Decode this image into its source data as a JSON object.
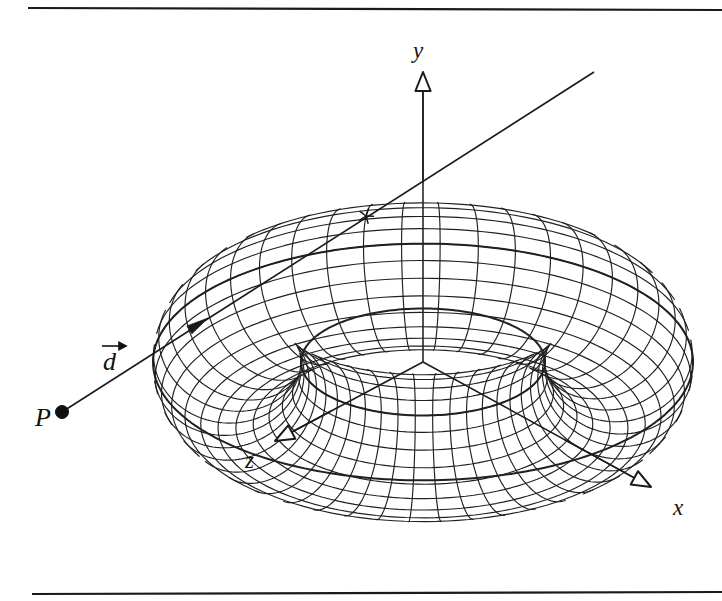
{
  "figure": {
    "background_color": "#ffffff",
    "ink_color": "#1a1a1a",
    "width": 722,
    "height": 601
  },
  "rules": {
    "top": {
      "name": "top-rule",
      "x1": 28,
      "y1": 8,
      "x2": 722,
      "y2": 10
    },
    "bottom": {
      "name": "bottom-rule",
      "x1": 32,
      "y1": 594,
      "x2": 722,
      "y2": 592
    }
  },
  "axes": {
    "origin": {
      "x": 423,
      "y": 362
    },
    "items": [
      {
        "id": "y",
        "label": "y",
        "label_x": 413,
        "label_y": 58,
        "tip_x": 423,
        "tip_y": 72,
        "head": "hollow-triangle"
      },
      {
        "id": "x",
        "label": "x",
        "label_x": 673,
        "label_y": 515,
        "tip_x": 651,
        "tip_y": 487,
        "head": "hollow-triangle"
      },
      {
        "id": "z",
        "label": "z",
        "label_x": 245,
        "label_y": 468,
        "tip_x": 275,
        "tip_y": 441,
        "head": "hollow-triangle"
      }
    ]
  },
  "ray": {
    "origin_label": "P",
    "origin_label_x": 35,
    "origin_label_y": 426,
    "origin_point": {
      "x": 62,
      "y": 412,
      "r": 6.5
    },
    "direction_label": "d",
    "direction_label_x": 103,
    "direction_label_y": 370,
    "direction_accent": "over-arrow",
    "arrowhead": {
      "x": 208,
      "y": 318
    },
    "end": {
      "x": 594,
      "y": 72
    },
    "entry_hit": {
      "x": 366,
      "y": 216
    },
    "hit_marker": "star-cross"
  },
  "torus": {
    "center": {
      "x": 423,
      "y": 362
    },
    "major_radius": 196,
    "minor_radius": 74,
    "major_segments": 44,
    "minor_segments": 26,
    "tilt_deg": 64,
    "spin_deg": -20,
    "stroke_color": "#202020"
  }
}
